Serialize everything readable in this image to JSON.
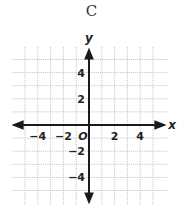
{
  "title": "C",
  "chart_data": {
    "type": "coordinate-plane",
    "title": "C",
    "xlabel": "x",
    "ylabel": "y",
    "origin_label": "O",
    "xlim": [
      -5,
      5
    ],
    "ylim": [
      -5,
      5
    ],
    "grid": true,
    "grid_step": 1,
    "x_tick_labels": [
      {
        "value": -4,
        "label": "−4"
      },
      {
        "value": -2,
        "label": "−2"
      },
      {
        "value": 2,
        "label": "2"
      },
      {
        "value": 4,
        "label": "4"
      }
    ],
    "y_tick_labels": [
      {
        "value": 4,
        "label": "4"
      },
      {
        "value": 2,
        "label": "2"
      },
      {
        "value": -2,
        "label": "−2"
      },
      {
        "value": -4,
        "label": "−4"
      }
    ],
    "colors": {
      "grid": "#b8b8b8",
      "axis": "#1a1a1a"
    }
  }
}
